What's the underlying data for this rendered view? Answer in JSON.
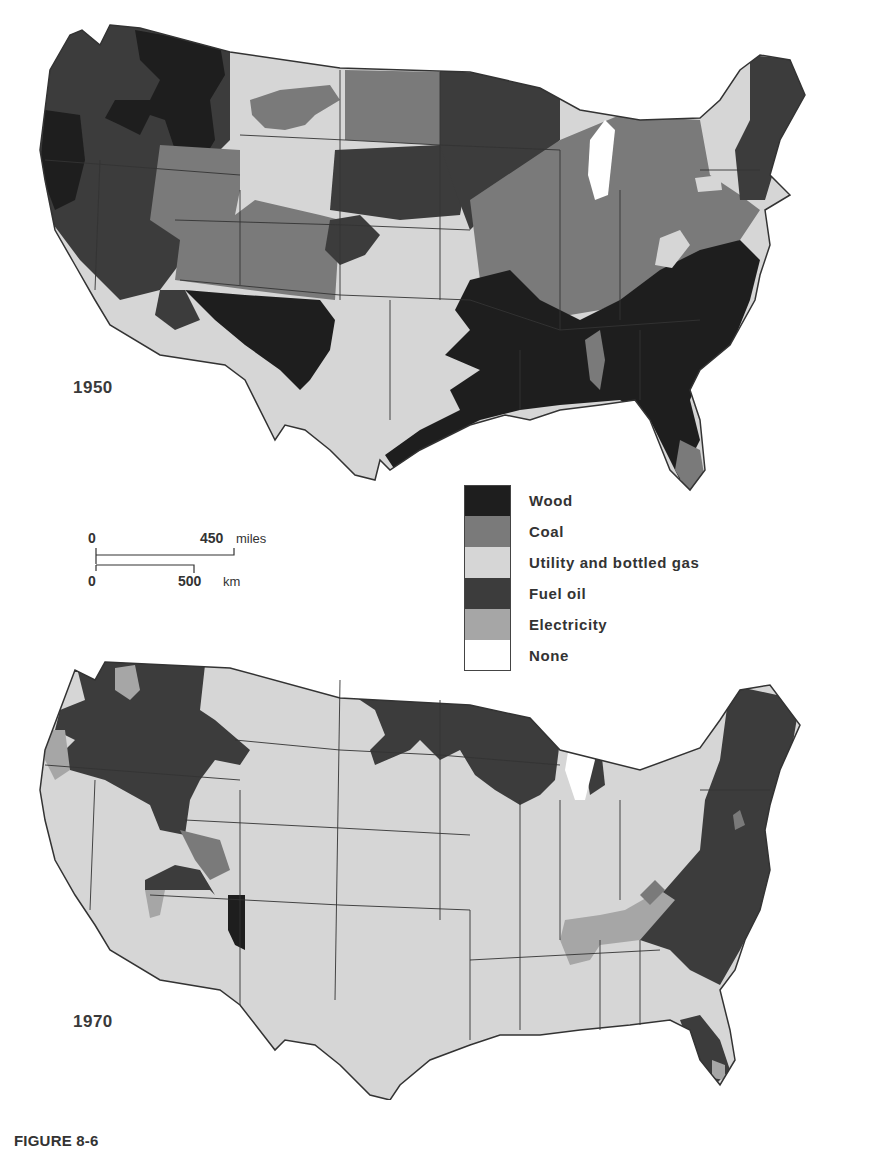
{
  "figure": {
    "caption": "FIGURE 8-6"
  },
  "maps": [
    {
      "year_label": "1950",
      "dominant": "Wood in Southeast, Fuel oil in Northwest and Northeast, Coal in Midwest and Northern Plains, Utility and bottled gas in Southwest and Plains"
    },
    {
      "year_label": "1970",
      "dominant": "Utility and bottled gas nationwide; Fuel oil in Northwest, Upper Midwest, Northeast and Atlantic coast; Electricity patches in Tennessee Valley, Pacific Northwest, Florida"
    }
  ],
  "legend": {
    "items": [
      {
        "label": "Wood",
        "color": "#1e1e1e"
      },
      {
        "label": "Coal",
        "color": "#7a7a7a"
      },
      {
        "label": "Utility and bottled gas",
        "color": "#d6d6d6"
      },
      {
        "label": "Fuel oil",
        "color": "#3c3c3c"
      },
      {
        "label": "Electricity",
        "color": "#a6a6a6"
      },
      {
        "label": "None",
        "color": "#ffffff"
      }
    ]
  },
  "scale_bar": {
    "miles_zero": "0",
    "miles_value": "450",
    "miles_unit": "miles",
    "km_zero": "0",
    "km_value": "500",
    "km_unit": "km"
  }
}
